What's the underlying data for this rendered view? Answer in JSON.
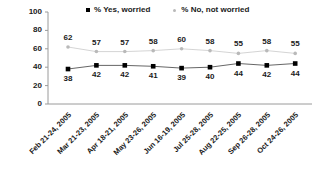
{
  "chart_data": {
    "type": "line",
    "title": "",
    "subtitle": "",
    "xlabel": "",
    "ylabel": "",
    "ylim": [
      0,
      100
    ],
    "yticks": [
      "0",
      "20",
      "40",
      "60",
      "80",
      "100"
    ],
    "grid": false,
    "legend_position": "top",
    "categories": [
      "Feb 21-24, 2005",
      "Mar 21-23, 2005",
      "Apr 18-21, 2005",
      "May 23-26, 2005",
      "Jun 16-19, 2005",
      "Jul 25-28, 2005",
      "Aug 22-25, 2005",
      "Sep 26-28, 2005",
      "Oct 24-26, 2005"
    ],
    "series": [
      {
        "name": "% Yes, worried",
        "color": "#000000",
        "marker": "square",
        "values": [
          38,
          42,
          42,
          41,
          39,
          40,
          44,
          42,
          44
        ],
        "label_position": "below"
      },
      {
        "name": "% No, not worried",
        "color": "#b9b9b9",
        "marker": "dot",
        "values": [
          62,
          57,
          57,
          58,
          60,
          58,
          55,
          58,
          55
        ],
        "label_position": "above"
      }
    ]
  },
  "legend": {
    "entries": [
      {
        "label": "% Yes, worried"
      },
      {
        "label": "% No, not worried"
      }
    ]
  },
  "colors": {
    "yes_series": "#000000",
    "no_series": "#b9b9b9",
    "axis": "#9a9a9a",
    "text": "#1a1a1a",
    "background": "#ffffff"
  }
}
